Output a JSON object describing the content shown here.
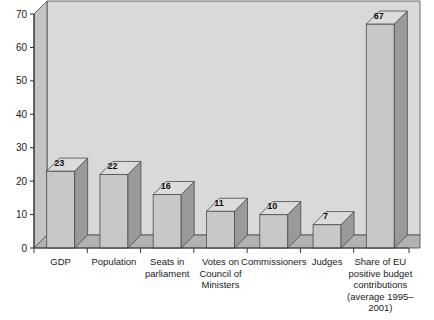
{
  "chart_data": {
    "type": "bar",
    "title": "",
    "subtitle": "",
    "xlabel": "",
    "ylabel": "",
    "ylim": [
      0,
      70
    ],
    "ytick_step": 10,
    "yticks": [
      0,
      10,
      20,
      30,
      40,
      50,
      60,
      70
    ],
    "grid": false,
    "legend": false,
    "legend_position": "none",
    "style": "3d-bar",
    "categories": [
      "GDP",
      "Population",
      "Seats in parliament",
      "Votes on Council of Ministers",
      "Commissioners",
      "Judges",
      "Share of EU positive budget contributions (average 1995–2001)"
    ],
    "category_lines": [
      [
        "GDP"
      ],
      [
        "Population"
      ],
      [
        "Seats in",
        "parliament"
      ],
      [
        "Votes on",
        "Council of",
        "Ministers"
      ],
      [
        "Commissioners"
      ],
      [
        "Judges"
      ],
      [
        "Share of EU",
        "positive budget",
        "contributions",
        "(average 1995–",
        "2001)"
      ]
    ],
    "values": [
      23,
      22,
      16,
      11,
      10,
      7,
      67
    ],
    "value_labels": [
      "23",
      "22",
      "16",
      "11",
      "10",
      "7",
      "67"
    ],
    "colors": {
      "bar_front": "#c8c8c8",
      "bar_side": "#9a9a9a",
      "bar_top": "#dcdcdc",
      "back_wall": "#d9d9d9",
      "left_wall": "#c4c4c4",
      "floor": "#b2b2b2",
      "axis": "#3c3c3c",
      "outline": "#4a4a4a",
      "background": "#ffffff",
      "text": "#1a1a1a"
    }
  },
  "axis": {
    "y_tick_0": "0",
    "y_tick_1": "10",
    "y_tick_2": "20",
    "y_tick_3": "30",
    "y_tick_4": "40",
    "y_tick_5": "50",
    "y_tick_6": "60",
    "y_tick_7": "70"
  }
}
